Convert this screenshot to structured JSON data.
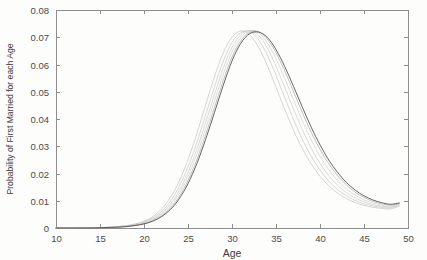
{
  "figure": {
    "title": "",
    "background_color": "#fdfdfc",
    "frame_color": "#8d8d8d"
  },
  "axes": {
    "x_title": "Age",
    "y_title": "Probability of First Married for each Age",
    "x_ticks": [
      "10",
      "15",
      "20",
      "25",
      "30",
      "35",
      "40",
      "45",
      "50"
    ],
    "y_ticks": [
      "0",
      "0.01",
      "0.02",
      "0.03",
      "0.04",
      "0.05",
      "0.06",
      "0.07",
      "0.08"
    ]
  },
  "chart_data": {
    "type": "line",
    "title": "",
    "subtitle": "",
    "xlabel": "Age",
    "ylabel": "Probability of First Married for each Age",
    "xlim": [
      10,
      50
    ],
    "ylim": [
      0,
      0.08
    ],
    "xticks": [
      10,
      15,
      20,
      25,
      30,
      35,
      40,
      45,
      50
    ],
    "yticks": [
      0,
      0.01,
      0.02,
      0.03,
      0.04,
      0.05,
      0.06,
      0.07,
      0.08
    ],
    "grid": false,
    "legend": false,
    "legend_position": "none",
    "annotations": [],
    "x": [
      10,
      12,
      14,
      16,
      17,
      18,
      19,
      20,
      21,
      22,
      23,
      24,
      25,
      26,
      27,
      28,
      29,
      30,
      31,
      32,
      33,
      34,
      35,
      36,
      37,
      38,
      39,
      40,
      41,
      42,
      43,
      44,
      45,
      46,
      47,
      48,
      49
    ],
    "series": [
      {
        "name": "curve-1",
        "color": "#b8b8b8",
        "peak_age": 31.4,
        "peak_value": 0.0724,
        "values": [
          0.0,
          0.0,
          0.0001,
          0.0003,
          0.0005,
          0.0009,
          0.0015,
          0.0025,
          0.0042,
          0.007,
          0.0112,
          0.0172,
          0.0251,
          0.0346,
          0.0451,
          0.0554,
          0.0642,
          0.07,
          0.0723,
          0.071,
          0.0665,
          0.0597,
          0.0517,
          0.0435,
          0.0358,
          0.0291,
          0.0235,
          0.019,
          0.0155,
          0.0128,
          0.0108,
          0.0093,
          0.0083,
          0.0076,
          0.0072,
          0.007,
          0.008
        ]
      },
      {
        "name": "curve-2",
        "color": "#bdbdbd",
        "peak_age": 31.9,
        "peak_value": 0.0725,
        "values": [
          0.0,
          0.0,
          0.0001,
          0.0003,
          0.0005,
          0.0008,
          0.0013,
          0.0022,
          0.0037,
          0.0061,
          0.0098,
          0.0152,
          0.0224,
          0.0313,
          0.0414,
          0.0518,
          0.0612,
          0.0681,
          0.0717,
          0.0721,
          0.0692,
          0.0635,
          0.056,
          0.0478,
          0.0398,
          0.0325,
          0.0263,
          0.0212,
          0.0172,
          0.0141,
          0.0118,
          0.0101,
          0.0089,
          0.0081,
          0.0076,
          0.0074,
          0.0084
        ]
      },
      {
        "name": "curve-3",
        "color": "#c2c2c2",
        "peak_age": 32.3,
        "peak_value": 0.0726,
        "values": [
          0.0,
          0.0,
          0.0001,
          0.0002,
          0.0004,
          0.0007,
          0.0012,
          0.002,
          0.0033,
          0.0055,
          0.0088,
          0.0137,
          0.0204,
          0.0288,
          0.0386,
          0.0489,
          0.0586,
          0.0663,
          0.0709,
          0.0725,
          0.0708,
          0.0661,
          0.0594,
          0.0516,
          0.0436,
          0.036,
          0.0293,
          0.0237,
          0.0192,
          0.0157,
          0.013,
          0.011,
          0.0096,
          0.0086,
          0.008,
          0.0077,
          0.0086
        ]
      },
      {
        "name": "curve-4",
        "color": "#c8c8c8",
        "peak_age": 32.7,
        "peak_value": 0.0727,
        "values": [
          0.0,
          0.0,
          0.0001,
          0.0002,
          0.0004,
          0.0006,
          0.0011,
          0.0018,
          0.003,
          0.005,
          0.0081,
          0.0126,
          0.0189,
          0.0269,
          0.0363,
          0.0465,
          0.0563,
          0.0645,
          0.0699,
          0.0724,
          0.0717,
          0.068,
          0.0621,
          0.0548,
          0.047,
          0.0393,
          0.0323,
          0.0263,
          0.0214,
          0.0174,
          0.0143,
          0.012,
          0.0103,
          0.0092,
          0.0084,
          0.008,
          0.0088
        ]
      },
      {
        "name": "curve-5",
        "color": "#9a9a9a",
        "peak_age": 33.0,
        "peak_value": 0.0722,
        "values": [
          0.0,
          0.0,
          0.0001,
          0.0002,
          0.0003,
          0.0006,
          0.001,
          0.0016,
          0.0027,
          0.0045,
          0.0073,
          0.0115,
          0.0174,
          0.025,
          0.0341,
          0.0441,
          0.054,
          0.0627,
          0.0687,
          0.0718,
          0.0721,
          0.0694,
          0.0643,
          0.0576,
          0.05,
          0.0423,
          0.0351,
          0.0288,
          0.0235,
          0.0192,
          0.0158,
          0.0131,
          0.0112,
          0.0098,
          0.0089,
          0.0084,
          0.009
        ]
      },
      {
        "name": "curve-6",
        "color": "#4a4a4a",
        "peak_age": 33.3,
        "peak_value": 0.0719,
        "values": [
          0.0,
          0.0,
          0.0,
          0.0002,
          0.0003,
          0.0005,
          0.0009,
          0.0015,
          0.0025,
          0.0042,
          0.0068,
          0.0107,
          0.0163,
          0.0236,
          0.0325,
          0.0423,
          0.0523,
          0.0613,
          0.0678,
          0.0713,
          0.0719,
          0.07,
          0.0655,
          0.0592,
          0.0519,
          0.0443,
          0.037,
          0.0305,
          0.0249,
          0.0204,
          0.0167,
          0.0139,
          0.0118,
          0.0103,
          0.0093,
          0.0087,
          0.0092
        ]
      }
    ]
  },
  "geometry": {
    "plot_left": 56,
    "plot_right": 408,
    "plot_top": 10,
    "plot_bottom": 228
  }
}
